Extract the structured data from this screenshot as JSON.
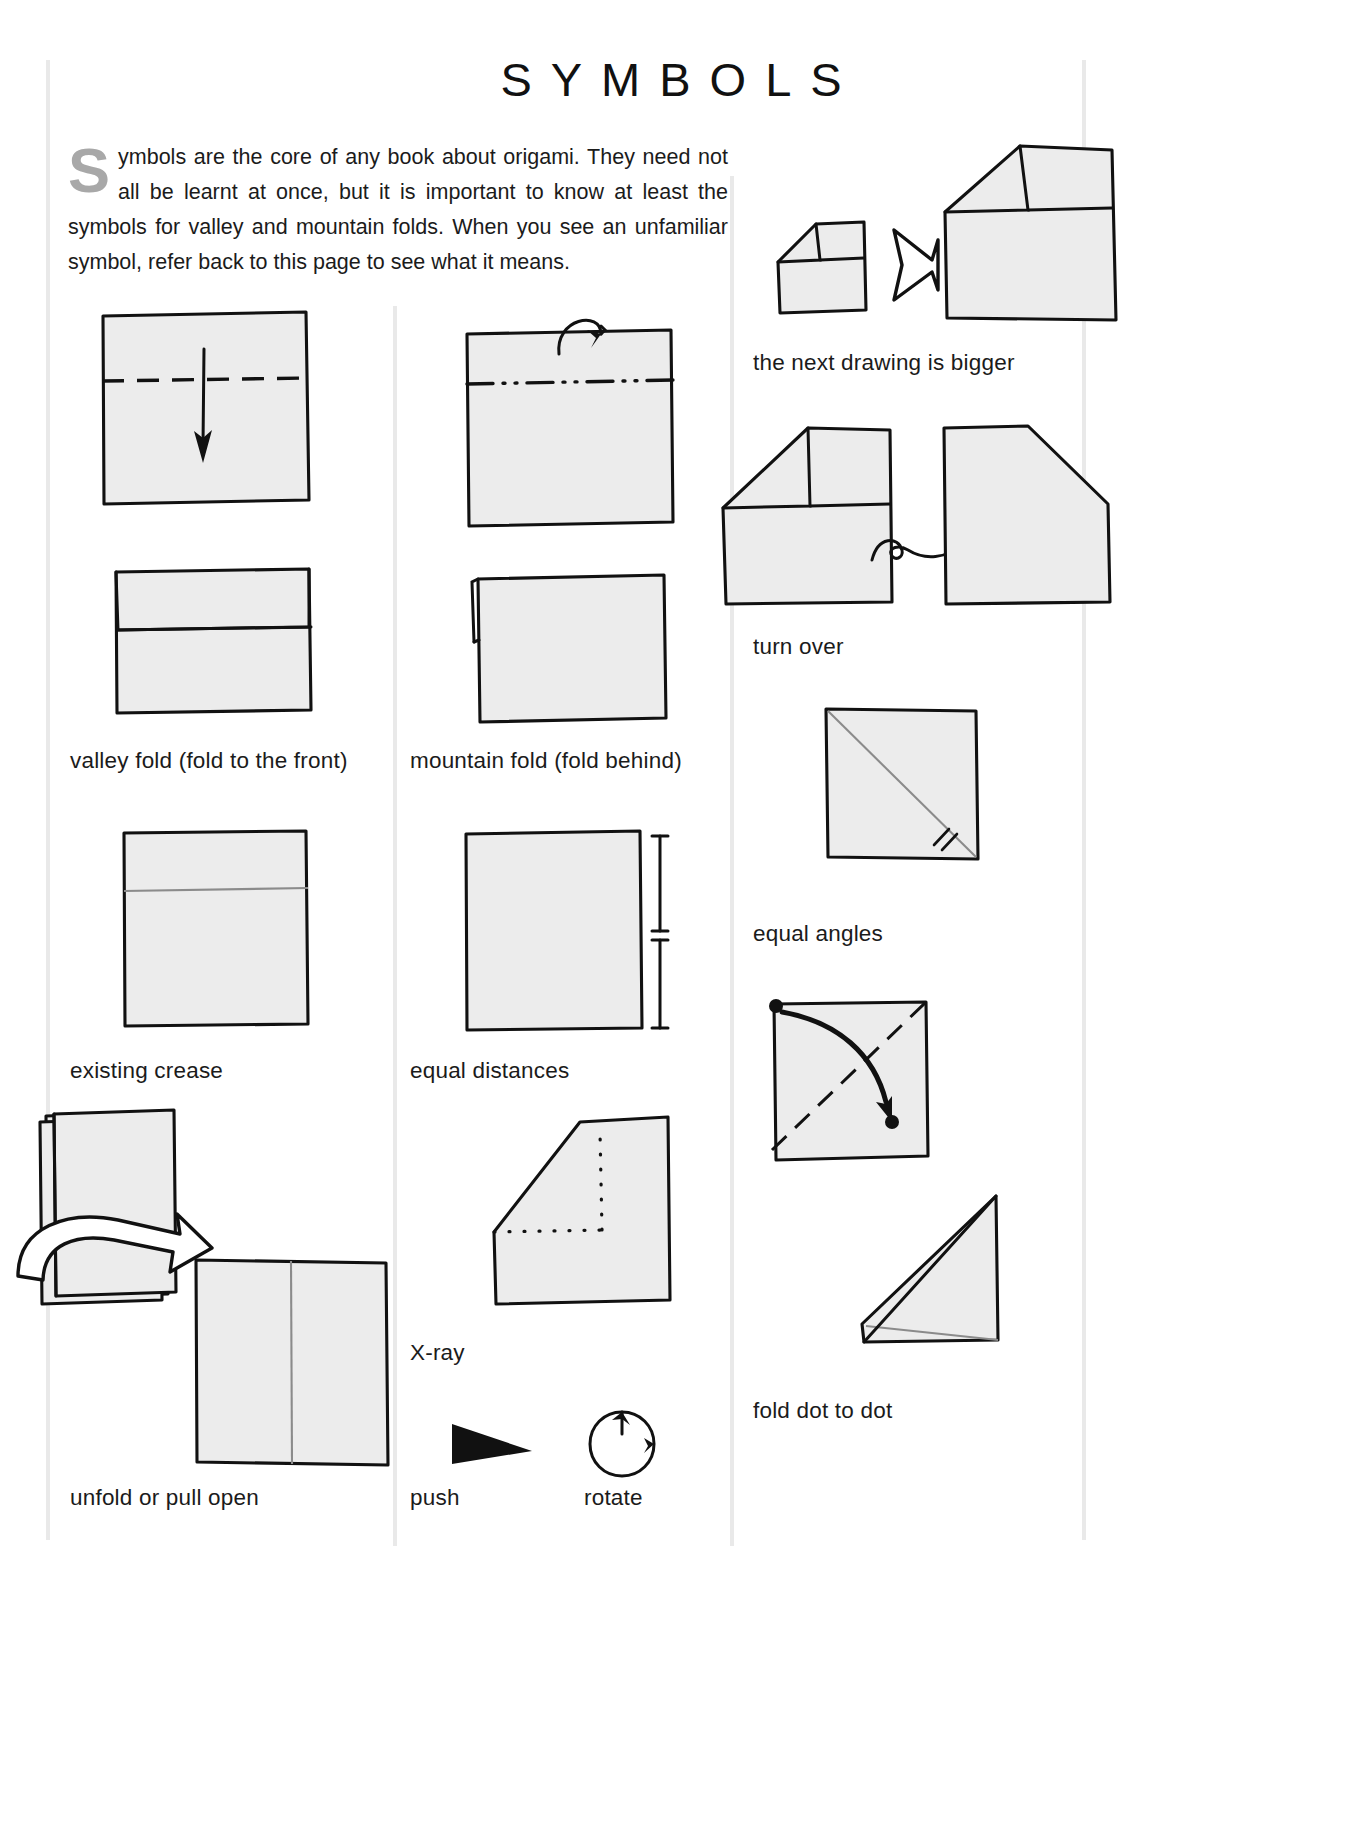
{
  "page": {
    "title": "SYMBOLS",
    "intro_dropcap": "S",
    "intro_text": "ymbols are the core of any book about origami. They need not all be learnt at once, but it is important to know at least the symbols for valley and mountain folds. When you see an unfamiliar symbol, refer back to this page to see what it means.",
    "background_color": "#ffffff",
    "paper_fill_color": "#ececec",
    "ink_color": "#111111",
    "dropcap_color": "#a8a8a8",
    "rule_color": "#e9e9e9"
  },
  "columns": {
    "left": {
      "captions": [
        {
          "id": "valley-fold",
          "label": "valley fold (fold to the front)"
        },
        {
          "id": "existing-crease",
          "label": "existing crease"
        },
        {
          "id": "unfold-or-pull-open",
          "label": "unfold or pull open"
        }
      ]
    },
    "middle": {
      "captions": [
        {
          "id": "mountain-fold",
          "label": "mountain fold (fold behind)"
        },
        {
          "id": "equal-distances",
          "label": "equal distances"
        },
        {
          "id": "x-ray",
          "label": "X-ray"
        },
        {
          "id": "push",
          "label": "push"
        },
        {
          "id": "rotate",
          "label": "rotate"
        }
      ]
    },
    "right": {
      "captions": [
        {
          "id": "next-drawing-is-bigger",
          "label": "the next drawing is bigger"
        },
        {
          "id": "turn-over",
          "label": "turn over"
        },
        {
          "id": "equal-angles",
          "label": "equal angles"
        },
        {
          "id": "fold-dot-to-dot",
          "label": "fold dot to dot"
        }
      ]
    }
  },
  "symbols": [
    {
      "name": "valley-fold",
      "line_style": "dashed",
      "arrow": "straight-down-solid"
    },
    {
      "name": "mountain-fold",
      "line_style": "dash-dot-dot",
      "arrow": "curved-over-top-hollow-head"
    },
    {
      "name": "existing-crease",
      "line_style": "thin-solid-gray"
    },
    {
      "name": "equal-distances",
      "line_style": "measurement-bars-with-ticks"
    },
    {
      "name": "unfold-or-pull-open",
      "arrow": "hollow-open-loop-arrow"
    },
    {
      "name": "x-ray",
      "line_style": "dotted"
    },
    {
      "name": "push",
      "arrow": "solid-black-triangle"
    },
    {
      "name": "rotate",
      "arrow": "circular-arrow"
    },
    {
      "name": "next-drawing-is-bigger",
      "arrow": "hollow-double-point-chevron"
    },
    {
      "name": "turn-over",
      "arrow": "looping-flip-arrow"
    },
    {
      "name": "equal-angles",
      "line_style": "diagonal-with-double-tick-marks"
    },
    {
      "name": "fold-dot-to-dot",
      "arrow": "curved-solid-arrow-between-dots"
    }
  ]
}
